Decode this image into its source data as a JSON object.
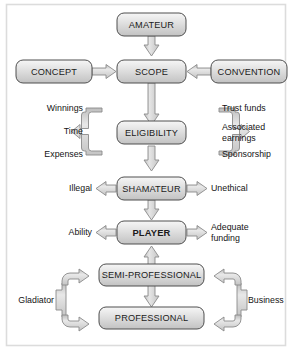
{
  "diagram": {
    "frame": {
      "border_color": "#d7d7d7",
      "background": "#ffffff"
    },
    "style": {
      "box_fill_top": "#f2f2f2",
      "box_fill_bottom": "#c9c9c9",
      "box_stroke": "#4a4a4a",
      "arrow_fill": "#d6d6d6",
      "arrow_stroke": "#7b7b7b",
      "text_color": "#1b1b1b"
    },
    "nodes": [
      {
        "id": "amateur",
        "label": "AMATEUR",
        "bold": false
      },
      {
        "id": "concept",
        "label": "CONCEPT",
        "bold": false
      },
      {
        "id": "scope",
        "label": "SCOPE",
        "bold": false
      },
      {
        "id": "convention",
        "label": "CONVENTION",
        "bold": false
      },
      {
        "id": "eligibility",
        "label": "ELIGIBILITY",
        "bold": false
      },
      {
        "id": "shamateur",
        "label": "SHAMATEUR",
        "bold": false
      },
      {
        "id": "player",
        "label": "PLAYER",
        "bold": true
      },
      {
        "id": "semiprofessional",
        "label": "SEMI-PROFESSIONAL",
        "bold": false
      },
      {
        "id": "professional",
        "label": "PROFESSIONAL",
        "bold": false
      }
    ],
    "side_labels": {
      "eligibility_left": [
        "Winnings",
        "Time",
        "Expenses"
      ],
      "eligibility_right": [
        "Trust funds",
        "Associated earnings",
        "Sponsorship"
      ],
      "shamateur_left": "Illegal",
      "shamateur_right": "Unethical",
      "player_left": "Ability",
      "player_right": "Adequate funding",
      "bottom_left": "Gladiator",
      "bottom_right": "Business"
    },
    "edges": [
      {
        "from": "amateur",
        "to": "scope",
        "type": "arrow-down"
      },
      {
        "from": "concept",
        "to": "scope",
        "type": "arrow-right"
      },
      {
        "from": "convention",
        "to": "scope",
        "type": "arrow-left"
      },
      {
        "from": "scope",
        "to": "eligibility",
        "type": "arrow-down"
      },
      {
        "from": "eligibility_left_bracket",
        "to": "eligibility",
        "type": "bracket-merge-right"
      },
      {
        "from": "eligibility_right_bracket",
        "to": "eligibility",
        "type": "bracket-merge-left"
      },
      {
        "from": "eligibility",
        "to": "shamateur",
        "type": "arrow-down"
      },
      {
        "from": "shamateur",
        "to": "shamateur_left",
        "type": "arrow-left"
      },
      {
        "from": "shamateur",
        "to": "shamateur_right",
        "type": "arrow-right"
      },
      {
        "from": "shamateur",
        "to": "player",
        "type": "arrow-down"
      },
      {
        "from": "player",
        "to": "player_left",
        "type": "arrow-left"
      },
      {
        "from": "player",
        "to": "player_right",
        "type": "arrow-right"
      },
      {
        "from": "semiprofessional",
        "to": "player",
        "type": "arrow-up"
      },
      {
        "from": "semiprofessional",
        "to": "professional",
        "type": "arrow-down"
      },
      {
        "from": "bottom_left",
        "to": "semiprofessional",
        "type": "split-arrow-up-right"
      },
      {
        "from": "bottom_left",
        "to": "professional",
        "type": "split-arrow-down-right"
      },
      {
        "from": "bottom_right",
        "to": "semiprofessional",
        "type": "split-arrow-up-left"
      },
      {
        "from": "bottom_right",
        "to": "professional",
        "type": "split-arrow-down-left"
      }
    ]
  }
}
